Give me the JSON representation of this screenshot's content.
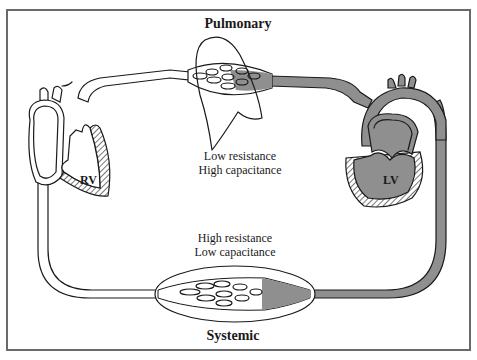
{
  "diagram": {
    "labels": {
      "pulmonary": "Pulmonary",
      "systemic": "Systemic",
      "rv": "RV",
      "lv": "LV"
    },
    "pulmonary_properties": [
      "Low resistance",
      "High capacitance"
    ],
    "systemic_properties": [
      "High resistance",
      "Low capacitance"
    ],
    "colors": {
      "oxygenated_blood": "#8f8f8f",
      "deoxygenated_blood": "#ffffff",
      "ink": "#1a1a1a",
      "frame": "#6a6a6a"
    }
  }
}
